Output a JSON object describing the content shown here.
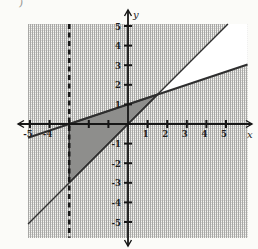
{
  "figure": {
    "name": "graph-of-system-of-linear-inequalities"
  },
  "artifact": {
    "glyph": ")"
  },
  "colors": {
    "page_bg": "#fbfbf8",
    "plane_white": "#ffffff",
    "halftone_bg": "#f4f4f0",
    "halftone_dot_dark": "#a8a8a6",
    "halftone_dot_light": "#d6d6d4",
    "triangle_fill": "#8e8e8c",
    "triangle_edge": "#3a3a3a",
    "line_color": "#2e2e2e",
    "axis_color": "#161616",
    "label_color": "#1c1c1c"
  },
  "chart_data": {
    "type": "line",
    "title": "",
    "xlabel": "x",
    "ylabel": "y",
    "xlim": [
      -5.1,
      6.1
    ],
    "ylim": [
      -5.8,
      5.1
    ],
    "grid": "halftone-dot shading covers plane except wedge between lines",
    "legend": "none",
    "x_ticks": [
      -5,
      -4,
      -3,
      -2,
      -1,
      1,
      2,
      3,
      4,
      5
    ],
    "y_ticks": [
      -5,
      -4,
      -3,
      -2,
      -1,
      1,
      2,
      3,
      4,
      5
    ],
    "x_tick_labels": [
      -5,
      -4,
      1,
      2,
      3,
      4,
      5
    ],
    "y_tick_labels": [
      5,
      4,
      3,
      2,
      1,
      -1,
      -2,
      -3,
      -4,
      -5
    ],
    "lines": [
      {
        "name": "line-y-equals-x",
        "equation": "y = x",
        "style": "solid",
        "slope": 1,
        "y_intercept": 0,
        "x1": -5.1,
        "y1": -5.1,
        "x2": 5.1,
        "y2": 5.1
      },
      {
        "name": "line-y-equals-one-third-x-plus-1",
        "equation": "y = (1/3)x + 1",
        "style": "solid",
        "slope": 0.3333,
        "y_intercept": 1,
        "x_intercept": -3,
        "x1": -5.1,
        "y1": -0.7,
        "x2": 6.1,
        "y2": 3.033
      },
      {
        "name": "line-x-equals-negative-3",
        "equation": "x = -3",
        "style": "dashed",
        "x1": -3,
        "y1": 5.1,
        "x2": -3,
        "y2": -5.8
      }
    ],
    "regions": [
      {
        "name": "unshaded-wedge",
        "description": "region below y = x and above y = (1/3)x + 1, right of their intersection; left unshaded",
        "fill": "white",
        "vertices": [
          [
            1.5,
            1.5
          ],
          [
            5.1,
            5.1
          ],
          [
            6.1,
            5.1
          ],
          [
            6.1,
            3.033
          ]
        ]
      },
      {
        "name": "solution-triangle",
        "description": "dark overlap region bounded by x = -3, y = x and y = (1/3)x + 1",
        "fill": "dark-gray",
        "vertices": [
          [
            -3,
            0
          ],
          [
            1.5,
            1.5
          ],
          [
            -3,
            -3
          ]
        ]
      }
    ],
    "intersection_point": [
      1.5,
      1.5
    ]
  }
}
